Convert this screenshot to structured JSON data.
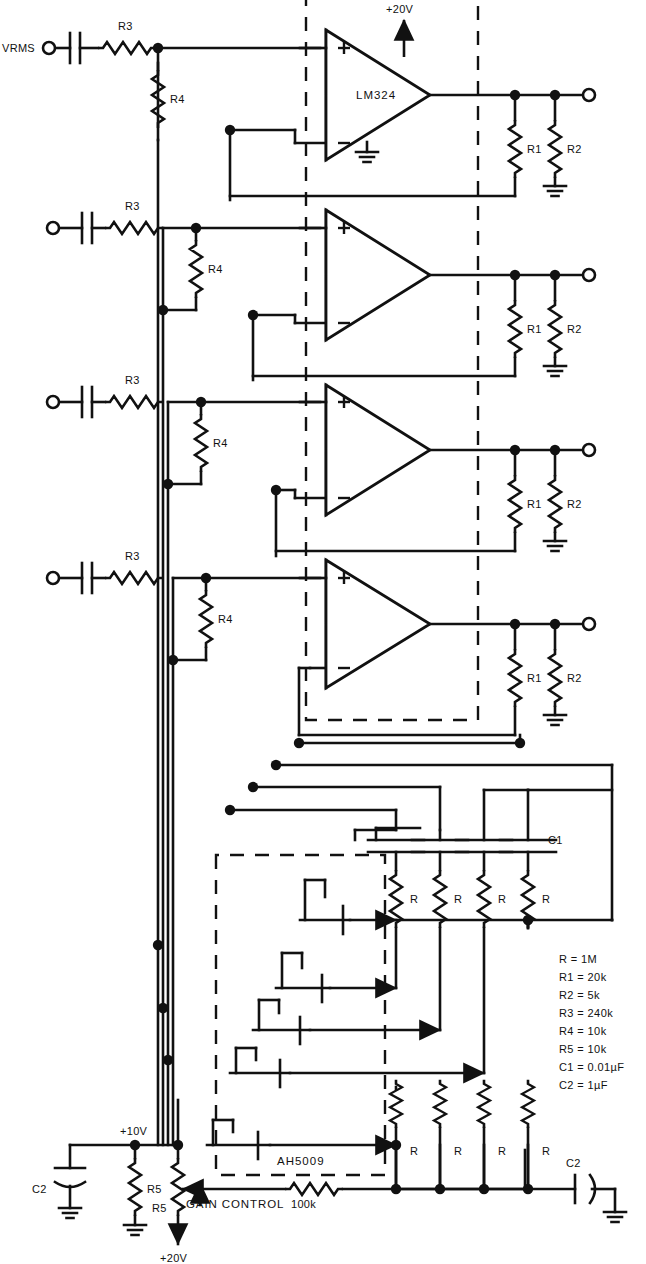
{
  "diagram": {
    "type": "schematic",
    "ic_opamp": "LM324",
    "ic_switch": "AH5009",
    "input_label": "VRMS",
    "supply_opamp": "+20V",
    "supply_mid": "+10V",
    "supply_bottom": "+20V",
    "gain_control_label": "GAIN CONTROL",
    "gain_pot_value": "100k",
    "cap_c1": "C1",
    "cap_c2": "C2",
    "res_r": "R",
    "res_r1": "R1",
    "res_r2": "R2",
    "res_r3": "R3",
    "res_r4": "R4",
    "res_r5": "R5"
  },
  "channels": [
    {
      "index": 1,
      "r3": "R3",
      "r4": "R4",
      "r1": "R1",
      "r2": "R2",
      "opamp": "LM324"
    },
    {
      "index": 2,
      "r3": "R3",
      "r4": "R4",
      "r1": "R1",
      "r2": "R2",
      "opamp": ""
    },
    {
      "index": 3,
      "r3": "R3",
      "r4": "R4",
      "r1": "R1",
      "r2": "R2",
      "opamp": ""
    },
    {
      "index": 4,
      "r3": "R3",
      "r4": "R4",
      "r1": "R1",
      "r2": "R2",
      "opamp": ""
    }
  ],
  "cap_bank": [
    "C1",
    "",
    "",
    ""
  ],
  "res_bank_top": [
    "R",
    "R",
    "R",
    "R"
  ],
  "res_bank_bottom": [
    "R",
    "R",
    "R",
    "R"
  ],
  "values": {
    "title": "",
    "lines": [
      "R = 1M",
      "R1 = 20k",
      "R2 = 5k",
      "R3 = 240k",
      "R4 = 10k",
      "R5 = 10k",
      "C1 = 0.01µF",
      "C2 = 1µF"
    ]
  },
  "colors": {
    "line": "#111111",
    "background": "#ffffff",
    "text": "#111111"
  }
}
